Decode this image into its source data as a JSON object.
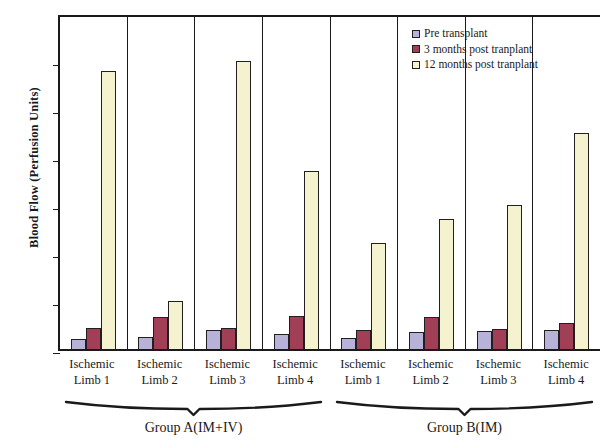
{
  "chart_data": {
    "type": "bar",
    "title": "",
    "xlabel": "",
    "ylabel": "Blood Flow (Perfusion Units)",
    "ylim": [
      0,
      350
    ],
    "yticks": [
      0,
      50,
      100,
      150,
      200,
      250,
      300,
      350
    ],
    "grid": false,
    "legend_position": "top-right",
    "categories": [
      "Ischemic Limb 1",
      "Ischemic Limb 2",
      "Ischemic Limb 3",
      "Ischemic Limb 4",
      "Ischemic Limb 1",
      "Ischemic Limb 2",
      "Ischemic Limb 3",
      "Ischemic Limb 4"
    ],
    "category_lines": [
      [
        "Ischemic",
        "Limb 1"
      ],
      [
        "Ischemic",
        "Limb 2"
      ],
      [
        "Ischemic",
        "Limb 3"
      ],
      [
        "Ischemic",
        "Limb 4"
      ],
      [
        "Ischemic",
        "Limb 1"
      ],
      [
        "Ischemic",
        "Limb 2"
      ],
      [
        "Ischemic",
        "Limb 3"
      ],
      [
        "Ischemic",
        "Limb 4"
      ]
    ],
    "series": [
      {
        "name": "Pre transplant",
        "color": "#b9b2d8",
        "values": [
          10,
          13,
          20,
          16,
          11,
          18,
          19,
          20
        ]
      },
      {
        "name": "3 months post tranplant",
        "color": "#a03f55",
        "values": [
          22,
          33,
          22,
          34,
          20,
          33,
          21,
          27
        ]
      },
      {
        "name": "12 months post tranplant",
        "color": "#f5f3cf",
        "values": [
          290,
          50,
          300,
          185,
          110,
          135,
          150,
          225
        ]
      }
    ],
    "groups": [
      {
        "label": "Group A(IM+IV)",
        "span": 4
      },
      {
        "label": "Group B(IM)",
        "span": 4
      }
    ]
  },
  "legend": {
    "items": [
      {
        "label": "Pre transplant",
        "swatch": "pre"
      },
      {
        "label": "3 months post tranplant",
        "swatch": "m3"
      },
      {
        "label": "12 months post tranplant",
        "swatch": "m12"
      }
    ]
  },
  "axis": {
    "y_title": "Blood Flow (Perfusion Units)",
    "y_tick_labels": [
      "350",
      "300",
      "250",
      "200",
      "150",
      "100",
      "50",
      "0"
    ]
  }
}
